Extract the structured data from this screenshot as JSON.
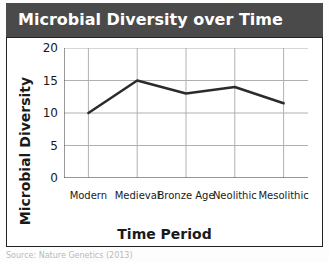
{
  "header": {
    "title": "Microbial Diversity over Time",
    "background_color": "#4a4a4a",
    "text_color": "#ffffff"
  },
  "footer": {
    "note": "Source: Nature Genetics (2013)"
  },
  "chart_data": {
    "type": "line",
    "title": "Microbial Diversity over Time",
    "xlabel": "Time Period",
    "ylabel": "Microbial Diversity",
    "categories": [
      "Modern",
      "Medieval",
      "Bronze Age",
      "Neolithic",
      "Mesolithic"
    ],
    "values": [
      10,
      15,
      13,
      14,
      11.5
    ],
    "ylim": [
      0,
      20
    ],
    "yticks": [
      0,
      5,
      10,
      15,
      20
    ],
    "ytick_labels": [
      "0",
      "5",
      "10",
      "15",
      "20"
    ],
    "grid": true,
    "legend": false,
    "line_color": "#2b2b2b",
    "line_width": 2.5,
    "grid_color": "#b0b0b0",
    "axis_color": "#555555"
  }
}
